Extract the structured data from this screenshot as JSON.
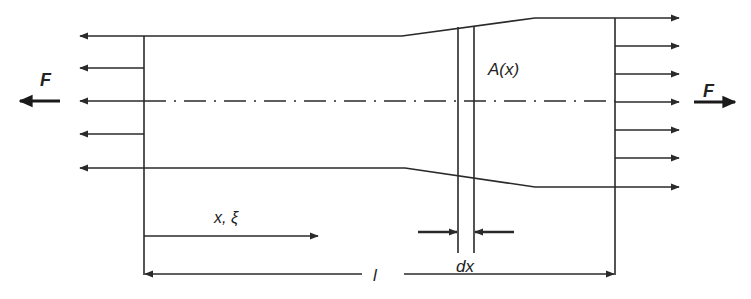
{
  "diagram": {
    "labels": {
      "force_left": "F",
      "force_right": "F",
      "area": "A(x)",
      "coordinate": "x, ξ",
      "length": "l",
      "element_width": "dx"
    },
    "colors": {
      "stroke": "#2a2a2a",
      "background": "#ffffff"
    },
    "left_end_stress_arrows": 5,
    "right_end_stress_arrows": 7
  }
}
